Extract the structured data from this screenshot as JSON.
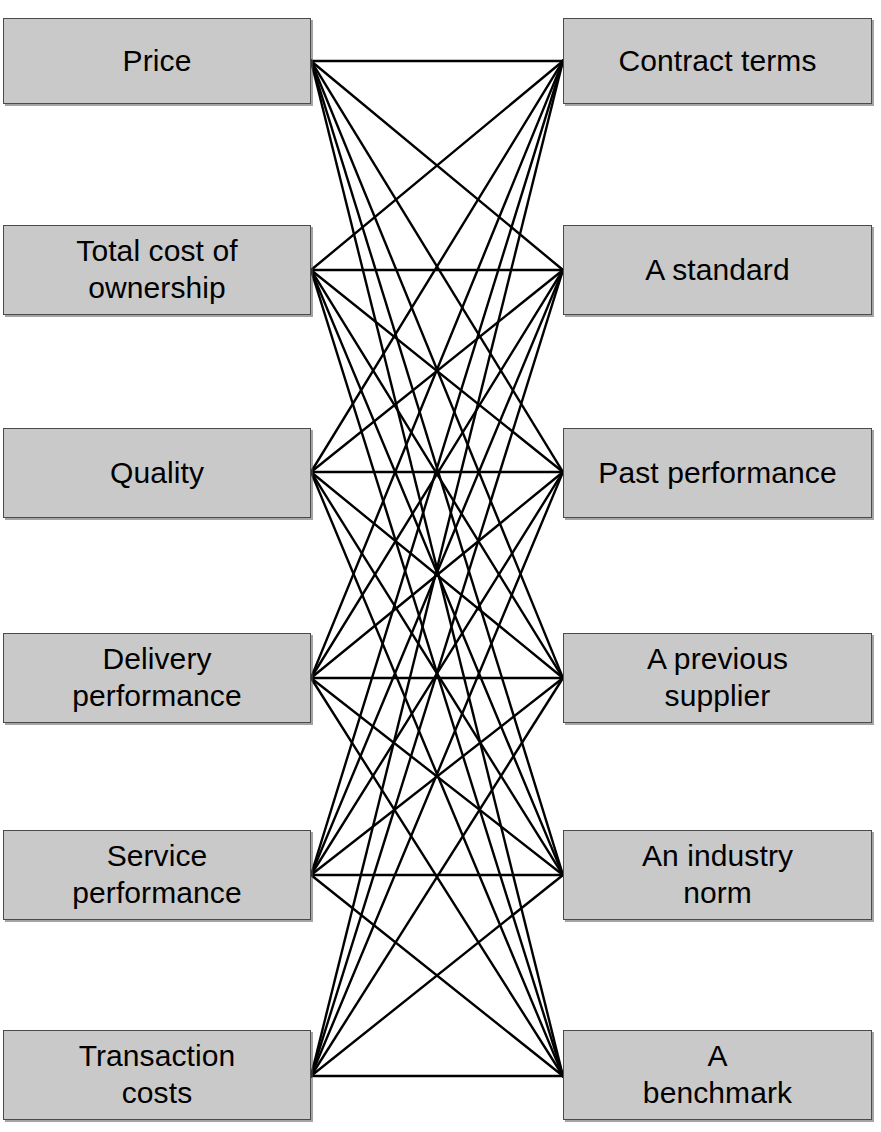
{
  "diagram": {
    "type": "bipartite-connection-diagram",
    "title": "",
    "background_color": "#ffffff",
    "box_fill_color": "#c9c9c9",
    "box_border_color": "#4a4a4a",
    "edge_color": "#000000",
    "text_color": "#000000",
    "left_column": {
      "name": "evaluation-criteria",
      "nodes": [
        {
          "id": "L1",
          "label": "Price",
          "x": 3,
          "y": 18,
          "w": 308,
          "h": 86,
          "anchor_x": 311,
          "anchor_y": 61
        },
        {
          "id": "L2",
          "label": "Total cost of\nownership",
          "x": 3,
          "y": 225,
          "w": 308,
          "h": 90,
          "anchor_x": 311,
          "anchor_y": 270
        },
        {
          "id": "L3",
          "label": "Quality",
          "x": 3,
          "y": 428,
          "w": 308,
          "h": 90,
          "anchor_x": 311,
          "anchor_y": 472
        },
        {
          "id": "L4",
          "label": "Delivery\nperformance",
          "x": 3,
          "y": 633,
          "w": 308,
          "h": 90,
          "anchor_x": 311,
          "anchor_y": 678
        },
        {
          "id": "L5",
          "label": "Service\nperformance",
          "x": 3,
          "y": 830,
          "w": 308,
          "h": 90,
          "anchor_x": 311,
          "anchor_y": 875
        },
        {
          "id": "L6",
          "label": "Transaction\ncosts",
          "x": 3,
          "y": 1030,
          "w": 308,
          "h": 90,
          "anchor_x": 311,
          "anchor_y": 1076
        }
      ]
    },
    "right_column": {
      "name": "comparison-references",
      "nodes": [
        {
          "id": "R1",
          "label": "Contract terms",
          "x": 563,
          "y": 18,
          "w": 309,
          "h": 86,
          "anchor_x": 563,
          "anchor_y": 61
        },
        {
          "id": "R2",
          "label": "A standard",
          "x": 563,
          "y": 225,
          "w": 309,
          "h": 90,
          "anchor_x": 563,
          "anchor_y": 270
        },
        {
          "id": "R3",
          "label": "Past performance",
          "x": 563,
          "y": 428,
          "w": 309,
          "h": 90,
          "anchor_x": 563,
          "anchor_y": 472
        },
        {
          "id": "R4",
          "label": "A previous\nsupplier",
          "x": 563,
          "y": 633,
          "w": 309,
          "h": 90,
          "anchor_x": 563,
          "anchor_y": 678
        },
        {
          "id": "R5",
          "label": "An  industry\nnorm",
          "x": 563,
          "y": 830,
          "w": 309,
          "h": 90,
          "anchor_x": 563,
          "anchor_y": 875
        },
        {
          "id": "R6",
          "label": "A\nbenchmark",
          "x": 563,
          "y": 1030,
          "w": 309,
          "h": 90,
          "anchor_x": 563,
          "anchor_y": 1076
        }
      ]
    },
    "edges": {
      "description": "complete bipartite connections",
      "pairs": [
        [
          "L1",
          "R1"
        ],
        [
          "L1",
          "R2"
        ],
        [
          "L1",
          "R3"
        ],
        [
          "L1",
          "R4"
        ],
        [
          "L1",
          "R5"
        ],
        [
          "L1",
          "R6"
        ],
        [
          "L2",
          "R1"
        ],
        [
          "L2",
          "R2"
        ],
        [
          "L2",
          "R3"
        ],
        [
          "L2",
          "R4"
        ],
        [
          "L2",
          "R5"
        ],
        [
          "L2",
          "R6"
        ],
        [
          "L3",
          "R1"
        ],
        [
          "L3",
          "R2"
        ],
        [
          "L3",
          "R3"
        ],
        [
          "L3",
          "R4"
        ],
        [
          "L3",
          "R5"
        ],
        [
          "L3",
          "R6"
        ],
        [
          "L4",
          "R1"
        ],
        [
          "L4",
          "R2"
        ],
        [
          "L4",
          "R3"
        ],
        [
          "L4",
          "R4"
        ],
        [
          "L4",
          "R5"
        ],
        [
          "L4",
          "R6"
        ],
        [
          "L5",
          "R1"
        ],
        [
          "L5",
          "R2"
        ],
        [
          "L5",
          "R3"
        ],
        [
          "L5",
          "R4"
        ],
        [
          "L5",
          "R5"
        ],
        [
          "L5",
          "R6"
        ],
        [
          "L6",
          "R1"
        ],
        [
          "L6",
          "R2"
        ],
        [
          "L6",
          "R3"
        ],
        [
          "L6",
          "R4"
        ],
        [
          "L6",
          "R5"
        ],
        [
          "L6",
          "R6"
        ]
      ],
      "stroke_width": 2.4
    }
  }
}
